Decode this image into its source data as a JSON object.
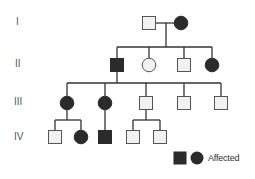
{
  "colors": {
    "affected": "#2b2b2b",
    "unaffected_fill": "#f2f2f2",
    "stroke": "#555555",
    "line": "#333333"
  },
  "generations": [
    {
      "label": "I",
      "y": 23
    },
    {
      "label": "II",
      "y": 65
    },
    {
      "label": "III",
      "y": 103
    },
    {
      "label": "IV",
      "y": 137
    }
  ],
  "individuals": [
    {
      "id": "I-1",
      "gen": "I",
      "sex": "male",
      "affected": false,
      "x": 149,
      "y": 23
    },
    {
      "id": "I-2",
      "gen": "I",
      "sex": "female",
      "affected": true,
      "x": 181,
      "y": 23
    },
    {
      "id": "II-1",
      "gen": "II",
      "sex": "male",
      "affected": true,
      "x": 117,
      "y": 65
    },
    {
      "id": "II-2",
      "gen": "II",
      "sex": "female",
      "affected": false,
      "x": 149,
      "y": 65
    },
    {
      "id": "II-3",
      "gen": "II",
      "sex": "male",
      "affected": false,
      "x": 184,
      "y": 65
    },
    {
      "id": "II-4",
      "gen": "II",
      "sex": "female",
      "affected": true,
      "x": 212,
      "y": 65
    },
    {
      "id": "III-1",
      "gen": "III",
      "sex": "female",
      "affected": true,
      "x": 67,
      "y": 103
    },
    {
      "id": "III-2",
      "gen": "III",
      "sex": "female",
      "affected": true,
      "x": 105,
      "y": 103
    },
    {
      "id": "III-3",
      "gen": "III",
      "sex": "male",
      "affected": false,
      "x": 146,
      "y": 103
    },
    {
      "id": "III-4",
      "gen": "III",
      "sex": "male",
      "affected": false,
      "x": 184,
      "y": 103
    },
    {
      "id": "III-5",
      "gen": "III",
      "sex": "male",
      "affected": false,
      "x": 221,
      "y": 103
    },
    {
      "id": "IV-1",
      "gen": "IV",
      "sex": "male",
      "affected": false,
      "x": 55,
      "y": 137
    },
    {
      "id": "IV-2",
      "gen": "IV",
      "sex": "female",
      "affected": true,
      "x": 81,
      "y": 137
    },
    {
      "id": "IV-3",
      "gen": "IV",
      "sex": "male",
      "affected": true,
      "x": 105,
      "y": 137
    },
    {
      "id": "IV-4",
      "gen": "IV",
      "sex": "male",
      "affected": false,
      "x": 133,
      "y": 137
    },
    {
      "id": "IV-5",
      "gen": "IV",
      "sex": "male",
      "affected": false,
      "x": 160,
      "y": 137
    }
  ],
  "legend": {
    "label": "Affected",
    "symbols": [
      "filled-square",
      "filled-circle"
    ]
  }
}
